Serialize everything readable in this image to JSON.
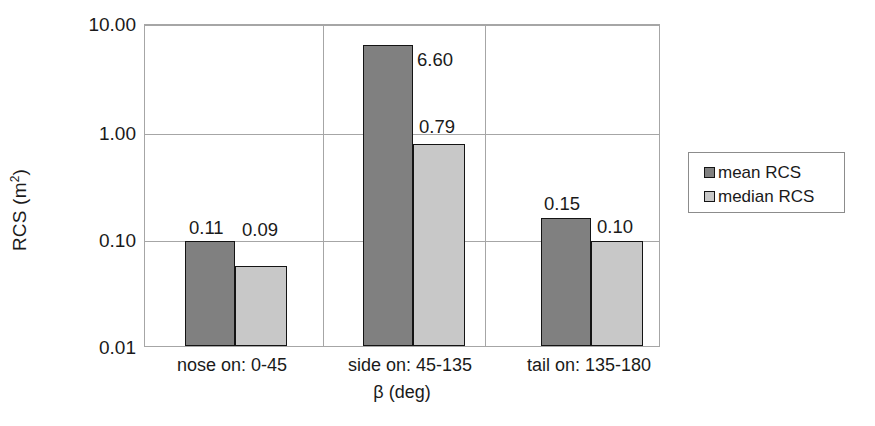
{
  "chart_data": {
    "type": "bar",
    "title": "",
    "subtitle": "",
    "xlabel": "β (deg)",
    "ylabel": "RCS (m²)",
    "ylabel_base": "RCS (m",
    "ylabel_exp": "2",
    "ylabel_close": ")",
    "yscale": "log",
    "ylim": [
      0.01,
      10.0
    ],
    "ytick_labels": [
      "10.00",
      "1.00",
      "0.10",
      "0.01"
    ],
    "ytick_values": [
      10.0,
      1.0,
      0.1,
      0.01
    ],
    "grid": "horizontal-and-vertical-separators",
    "legend_position": "right",
    "categories": [
      "nose on:  0-45",
      "side on: 45-135",
      "tail on: 135-180"
    ],
    "series": [
      {
        "name": "mean RCS",
        "color": "#808080",
        "values": [
          0.11,
          6.6,
          0.15
        ],
        "labels": [
          "0.11",
          "6.60",
          "0.15"
        ]
      },
      {
        "name": "median RCS",
        "color": "#c8c8c8",
        "values": [
          0.09,
          0.79,
          0.1
        ],
        "labels": [
          "0.09",
          "0.79",
          "0.10"
        ]
      }
    ]
  },
  "axes": {
    "y_ticks": [
      {
        "label": "10.00",
        "top_px": 24
      },
      {
        "label": "1.00",
        "top_px": 133
      },
      {
        "label": "0.10",
        "top_px": 240
      },
      {
        "label": "0.01",
        "top_px": 347
      }
    ],
    "x_ticks": [
      {
        "label": "nose on:  0-45",
        "center_px": 232
      },
      {
        "label": "side on: 45-135",
        "center_px": 410
      },
      {
        "label": "tail on: 135-180",
        "center_px": 589
      }
    ],
    "x_title": "β (deg)"
  },
  "bars": [
    {
      "series": "mean RCS",
      "category": "nose on:  0-45",
      "label": "0.11",
      "left_px": 40,
      "width_px": 50,
      "top_px": 216,
      "label_left_px": 44,
      "label_top_px": 194
    },
    {
      "series": "median RCS",
      "category": "nose on:  0-45",
      "label": "0.09",
      "left_px": 90,
      "width_px": 52,
      "top_px": 241,
      "label_left_px": 97,
      "label_top_px": 196
    },
    {
      "series": "mean RCS",
      "category": "side on: 45-135",
      "label": "6.60",
      "left_px": 218,
      "width_px": 50,
      "top_px": 20,
      "label_left_px": 272,
      "label_top_px": 26
    },
    {
      "series": "median RCS",
      "category": "side on: 45-135",
      "label": "0.79",
      "left_px": 268,
      "width_px": 52,
      "top_px": 119,
      "label_left_px": 274,
      "label_top_px": 93
    },
    {
      "series": "mean RCS",
      "category": "tail on: 135-180",
      "label": "0.15",
      "left_px": 396,
      "width_px": 50,
      "top_px": 193,
      "label_left_px": 399,
      "label_top_px": 170
    },
    {
      "series": "median RCS",
      "category": "tail on: 135-180",
      "label": "0.10",
      "left_px": 446,
      "width_px": 52,
      "top_px": 216,
      "label_left_px": 452,
      "label_top_px": 193
    }
  ],
  "gridlines": {
    "horizontal_top_px": [
      0,
      109,
      216
    ],
    "vertical_left_px": [
      178,
      340
    ]
  },
  "legend": {
    "items": [
      {
        "label": "mean RCS",
        "color": "#808080"
      },
      {
        "label": "median RCS",
        "color": "#c8c8c8"
      }
    ]
  },
  "colors": {
    "mean": "#808080",
    "median": "#c8c8c8",
    "bar_outline": "#141414",
    "grid": "#a6a6a6",
    "text": "#1a1a1a",
    "background": "#ffffff"
  }
}
